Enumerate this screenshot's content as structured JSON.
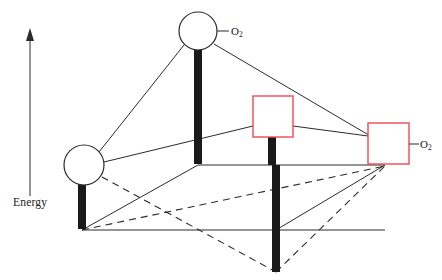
{
  "figure": {
    "type": "energy-level-cube-diagram",
    "background": "#ffffff",
    "width": 442,
    "height": 280
  },
  "axis": {
    "label": "Energy",
    "direction": "up",
    "arrow": {
      "x": 30,
      "y_top": 28,
      "y_bottom": 196
    },
    "label_pos": {
      "x": 13,
      "y": 196
    }
  },
  "colors": {
    "line": "#2b2b2b",
    "bar": "#1a1a1a",
    "circle_stroke": "#2b2b2b",
    "circle_fill": "#ffffff",
    "square_stroke": "#ef4a52",
    "square_fill": "#ffffff",
    "text": "#1a1a1a",
    "dashed": "#2b2b2b"
  },
  "nodes": [
    {
      "id": "circle-top",
      "shape": "circle",
      "cx": 198,
      "cy": 31,
      "r": 19,
      "label": "O2",
      "label_text": "O",
      "label_sub": "2",
      "label_pos": {
        "x": 231,
        "y": 25
      },
      "leader": {
        "x1": 217,
        "y1": 31,
        "x2": 229,
        "y2": 31
      }
    },
    {
      "id": "circle-left",
      "shape": "circle",
      "cx": 84,
      "cy": 165,
      "r": 20,
      "label": null
    },
    {
      "id": "square-middle",
      "shape": "square",
      "x": 253,
      "y": 96,
      "w": 40,
      "h": 41,
      "label": null
    },
    {
      "id": "square-right",
      "shape": "square",
      "x": 368,
      "y": 123,
      "w": 41,
      "h": 41,
      "label": "O2",
      "label_text": "O",
      "label_sub": "2",
      "label_pos": {
        "x": 420,
        "y": 138
      },
      "leader": {
        "x1": 409,
        "y1": 144,
        "x2": 419,
        "y2": 144
      }
    }
  ],
  "bars": [
    {
      "id": "bar-top-center",
      "x": 194,
      "y_top": 49,
      "y_bottom": 164,
      "width": 8
    },
    {
      "id": "bar-left",
      "x": 78,
      "y_top": 184,
      "y_bottom": 229,
      "width": 8
    },
    {
      "id": "bar-middle-square",
      "x": 268,
      "y_top": 137,
      "y_bottom": 165,
      "width": 8
    },
    {
      "id": "bar-bottom-center",
      "x": 272,
      "y_top": 165,
      "y_bottom": 272,
      "width": 8
    }
  ],
  "edges_solid": [
    {
      "id": "edge-topcircle-to-leftcircle",
      "x1": 184,
      "y1": 45,
      "x2": 99,
      "y2": 152
    },
    {
      "id": "edge-topcircle-to-rightsquare",
      "x1": 214,
      "y1": 44,
      "x2": 372,
      "y2": 137
    },
    {
      "id": "edge-leftcircle-to-middlesquare",
      "x1": 104,
      "y1": 162,
      "x2": 253,
      "y2": 126
    },
    {
      "id": "edge-middlesquare-to-rightsquare",
      "x1": 293,
      "y1": 126,
      "x2": 368,
      "y2": 136
    },
    {
      "id": "edge-topbar-base-to-rightsquare-base",
      "x1": 198,
      "y1": 165,
      "x2": 385,
      "y2": 165
    },
    {
      "id": "edge-leftbar-base-to-bottombar-base",
      "x1": 82,
      "y1": 230,
      "x2": 385,
      "y2": 230
    },
    {
      "id": "edge-leftbar-base-to-topbar-base",
      "x1": 82,
      "y1": 230,
      "x2": 198,
      "y2": 165
    },
    {
      "id": "edge-bottombar-base-to-rightsquare-base",
      "x1": 276,
      "y1": 230,
      "x2": 385,
      "y2": 165
    }
  ],
  "edges_dashed": [
    {
      "id": "dashed-leftcircle-to-bottombar-base",
      "x1": 102,
      "y1": 177,
      "x2": 276,
      "y2": 272
    },
    {
      "id": "dashed-bottombar-base-to-rightsquare-base",
      "x1": 276,
      "y1": 272,
      "x2": 385,
      "y2": 166
    },
    {
      "id": "dashed-leftbar-base-to-rightsquare-base",
      "x1": 82,
      "y1": 230,
      "x2": 385,
      "y2": 166
    }
  ]
}
